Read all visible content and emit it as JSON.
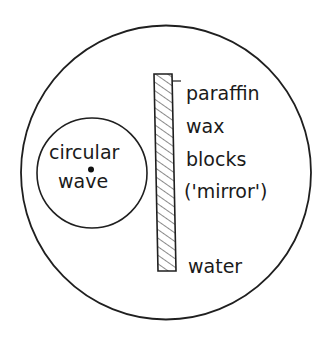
{
  "diagram": {
    "type": "ripple-tank-reflection",
    "colors": {
      "stroke": "#1f1f1f",
      "background": "#ffffff",
      "hatch": "#555555"
    },
    "tank": {
      "label": "water"
    },
    "source": {
      "label_line1": "circular",
      "label_line2": "wave"
    },
    "barrier": {
      "label_lines": [
        "paraffin",
        "wax",
        "blocks",
        "('mirror')"
      ]
    }
  }
}
